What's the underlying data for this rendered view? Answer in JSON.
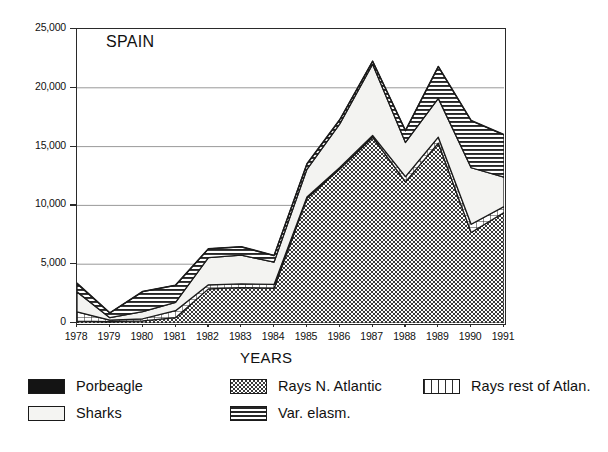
{
  "chart_label": "SPAIN",
  "axes": {
    "ylabel": "TONNES",
    "xlabel": "YEARS",
    "yticks": [
      "0",
      "5,000",
      "10,000",
      "15,000",
      "20,000",
      "25,000"
    ],
    "xticks": [
      "1978",
      "1979",
      "1980",
      "1981",
      "1982",
      "1983",
      "1984",
      "1985",
      "1986",
      "1987",
      "1988",
      "1989",
      "1990",
      "1991"
    ]
  },
  "legend": {
    "items": [
      {
        "label": "Porbeagle",
        "pattern": "solid-black",
        "swatch_class": "sw-porbeagle"
      },
      {
        "label": "Sharks",
        "pattern": "light-plain",
        "swatch_class": "sw-sharks"
      },
      {
        "label": "Rays N. Atlantic",
        "pattern": "checkerboard",
        "swatch_class": "sw-raysna"
      },
      {
        "label": "Var. elasm.",
        "pattern": "horizontal-lines",
        "swatch_class": "sw-varelasm"
      },
      {
        "label": "Rays rest of Atlan.",
        "pattern": "grid",
        "swatch_class": "sw-raysrest"
      }
    ]
  },
  "chart_data": {
    "type": "area",
    "stacked": true,
    "title": "SPAIN",
    "xlabel": "YEARS",
    "ylabel": "TONNES",
    "ylim": [
      0,
      25000
    ],
    "grid": true,
    "legend_position": "below-plot",
    "categories": [
      "1978",
      "1979",
      "1980",
      "1981",
      "1982",
      "1983",
      "1984",
      "1985",
      "1986",
      "1987",
      "1988",
      "1989",
      "1990",
      "1991"
    ],
    "series": [
      {
        "name": "Rays N. Atlantic",
        "pattern": "checkerboard",
        "values": [
          150,
          120,
          180,
          450,
          2900,
          3000,
          2950,
          10600,
          13100,
          15800,
          12000,
          15300,
          7700,
          9400
        ]
      },
      {
        "name": "Rays rest of Atlan.",
        "pattern": "grid",
        "values": [
          800,
          130,
          180,
          600,
          350,
          320,
          330,
          120,
          130,
          150,
          450,
          500,
          700,
          500
        ]
      },
      {
        "name": "Sharks",
        "pattern": "light-plain",
        "values": [
          1700,
          200,
          600,
          700,
          2300,
          2450,
          1900,
          2350,
          3700,
          6050,
          2900,
          3300,
          4800,
          2500
        ]
      },
      {
        "name": "Var. elasm.",
        "pattern": "horizontal-lines",
        "values": [
          700,
          400,
          1700,
          1450,
          750,
          700,
          550,
          450,
          350,
          250,
          1000,
          2700,
          4000,
          3600
        ]
      },
      {
        "name": "Porbeagle",
        "pattern": "solid-black",
        "values": [
          50,
          30,
          30,
          30,
          30,
          30,
          30,
          30,
          30,
          30,
          30,
          30,
          30,
          30
        ]
      }
    ],
    "stacked_totals": [
      3400,
      880,
      2690,
      3230,
      6330,
      6500,
      5760,
      13550,
      17310,
      22280,
      16380,
      21830,
      17230,
      16030
    ]
  }
}
